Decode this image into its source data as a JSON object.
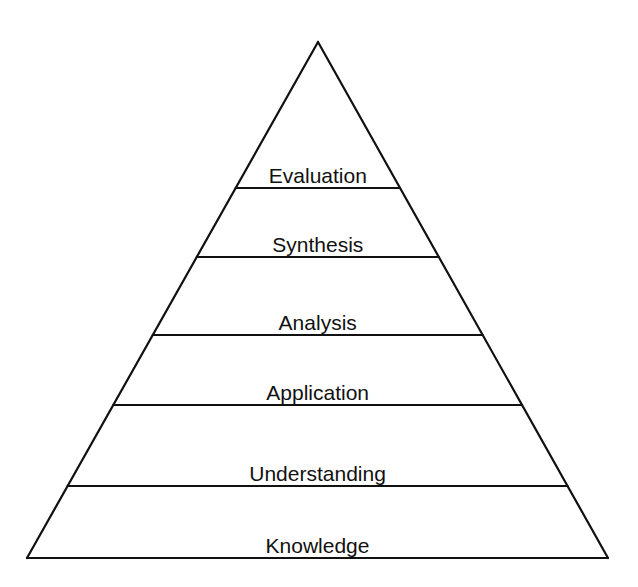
{
  "diagram": {
    "type": "pyramid",
    "stroke_color": "#111111",
    "apex": [
      318,
      42
    ],
    "base_left": [
      27,
      558
    ],
    "base_right": [
      608,
      558
    ],
    "levels": [
      {
        "label": "Evaluation",
        "line_y": 188
      },
      {
        "label": "Synthesis",
        "line_y": 257
      },
      {
        "label": "Analysis",
        "line_y": 335
      },
      {
        "label": "Application",
        "line_y": 405
      },
      {
        "label": "Understanding",
        "line_y": 486
      },
      {
        "label": "Knowledge",
        "line_y": 558
      }
    ]
  }
}
